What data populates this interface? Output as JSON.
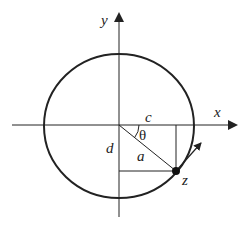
{
  "diagram": {
    "type": "geometry",
    "labels": {
      "y_axis": "y",
      "x_axis": "x",
      "horizontal_leg": "c",
      "vertical_leg": "d",
      "radius": "a",
      "angle": "θ",
      "point": "z"
    },
    "colors": {
      "stroke": "#222222",
      "background": "#ffffff"
    }
  }
}
